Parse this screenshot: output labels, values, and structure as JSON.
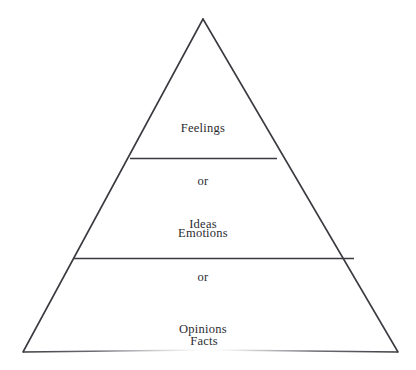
{
  "diagram": {
    "kind": "pyramid-diagram",
    "background_color": "#ffffff",
    "stroke_color": "#3a3a40",
    "text_color": "#2b2b30",
    "tiers": [
      {
        "position": "top",
        "name": "feelings-tier",
        "lines": [
          "Feelings",
          "or",
          "Emotions"
        ],
        "line1": "Feelings",
        "line2": "or",
        "line3": "Emotions"
      },
      {
        "position": "middle",
        "name": "ideas-tier",
        "lines": [
          "Ideas",
          "or",
          "Opinions"
        ],
        "line1": "Ideas",
        "line2": "or",
        "line3": "Opinions"
      },
      {
        "position": "bottom",
        "name": "facts-tier",
        "lines": [
          "Facts"
        ],
        "line1": "Facts"
      }
    ]
  }
}
